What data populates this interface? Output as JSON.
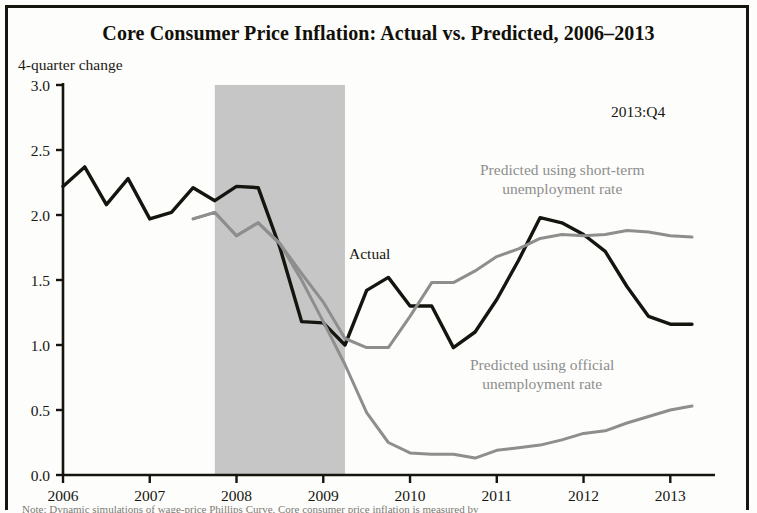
{
  "figure": {
    "title": "Core Consumer Price Inflation: Actual vs. Predicted, 2006–2013",
    "y_axis_caption": "4-quarter change",
    "date_annotation": "2013:Q4",
    "note": "Note: Dynamic simulations of wage-price Phillips Curve. Core consumer price inflation is measured by"
  },
  "labels": {
    "actual": "Actual",
    "predicted_short_line1": "Predicted using short-term",
    "predicted_short_line2": "unemployment rate",
    "predicted_official_line1": "Predicted using official",
    "predicted_official_line2": "unemployment rate"
  },
  "colors": {
    "actual_line": "#15140f",
    "predicted_line": "#8e8e8e",
    "recession_shading": "#c6c6c6",
    "axis": "#15140f",
    "background": "#fdfdfb",
    "frame": "#15140f"
  },
  "chart_data": {
    "type": "line",
    "title": "Core Consumer Price Inflation: Actual vs. Predicted, 2006–2013",
    "xlabel": "",
    "ylabel": "4-quarter change",
    "xlim": [
      2006.0,
      2013.4
    ],
    "ylim": [
      0.0,
      3.0
    ],
    "grid": false,
    "legend_position": "inline-annotations",
    "x_tick_labels": [
      "2006",
      "2007",
      "2008",
      "2009",
      "2010",
      "2011",
      "2012",
      "2013"
    ],
    "x_ticks": [
      2006,
      2007,
      2008,
      2009,
      2010,
      2011,
      2012,
      2013
    ],
    "y_tick_labels": [
      "0.0",
      "0.5",
      "1.0",
      "1.5",
      "2.0",
      "2.5",
      "3.0"
    ],
    "y_ticks": [
      0.0,
      0.5,
      1.0,
      1.5,
      2.0,
      2.5,
      3.0
    ],
    "shaded_regions": [
      {
        "label": "recession",
        "x_start": 2007.75,
        "x_end": 2009.25,
        "color": "#c6c6c6"
      }
    ],
    "annotations": [
      {
        "text": "2013:Q4",
        "x": 2012.9,
        "y": 2.72
      },
      {
        "text": "Actual",
        "x": 2009.75,
        "y": 1.7
      },
      {
        "text": "Predicted using short-term unemployment rate",
        "x": 2011.6,
        "y": 2.35
      },
      {
        "text": "Predicted using official unemployment rate",
        "x": 2011.5,
        "y": 0.86
      }
    ],
    "series": [
      {
        "name": "Actual",
        "color": "#15140f",
        "x": [
          2006.0,
          2006.25,
          2006.5,
          2006.75,
          2007.0,
          2007.25,
          2007.5,
          2007.75,
          2008.0,
          2008.25,
          2008.5,
          2008.75,
          2009.0,
          2009.25,
          2009.5,
          2009.75,
          2010.0,
          2010.25,
          2010.5,
          2010.75,
          2011.0,
          2011.25,
          2011.5,
          2011.75,
          2012.0,
          2012.25,
          2012.5,
          2012.75,
          2013.0,
          2013.25
        ],
        "values": [
          2.22,
          2.37,
          2.08,
          2.28,
          1.97,
          2.02,
          2.21,
          2.11,
          2.22,
          2.21,
          1.75,
          1.18,
          1.17,
          1.0,
          1.42,
          1.52,
          1.3,
          1.3,
          0.98,
          1.1,
          1.35,
          1.65,
          1.98,
          1.94,
          1.85,
          1.72,
          1.45,
          1.22,
          1.16,
          1.16
        ]
      },
      {
        "name": "Predicted using short-term unemployment rate",
        "color": "#8e8e8e",
        "x": [
          2007.5,
          2007.75,
          2008.0,
          2008.25,
          2008.5,
          2008.75,
          2009.0,
          2009.25,
          2009.5,
          2009.75,
          2010.0,
          2010.25,
          2010.5,
          2010.75,
          2011.0,
          2011.25,
          2011.5,
          2011.75,
          2012.0,
          2012.25,
          2012.5,
          2012.75,
          2013.0,
          2013.25
        ],
        "values": [
          1.97,
          2.02,
          1.84,
          1.94,
          1.78,
          1.55,
          1.33,
          1.05,
          0.98,
          0.98,
          1.22,
          1.48,
          1.48,
          1.57,
          1.68,
          1.74,
          1.82,
          1.85,
          1.84,
          1.85,
          1.88,
          1.87,
          1.84,
          1.83
        ]
      },
      {
        "name": "Predicted using official unemployment rate",
        "color": "#8e8e8e",
        "x": [
          2007.5,
          2007.75,
          2008.0,
          2008.25,
          2008.5,
          2008.75,
          2009.0,
          2009.25,
          2009.5,
          2009.75,
          2010.0,
          2010.25,
          2010.5,
          2010.75,
          2011.0,
          2011.25,
          2011.5,
          2011.75,
          2012.0,
          2012.25,
          2012.5,
          2012.75,
          2013.0,
          2013.25
        ],
        "values": [
          1.97,
          2.02,
          1.84,
          1.94,
          1.78,
          1.5,
          1.18,
          0.85,
          0.48,
          0.25,
          0.17,
          0.16,
          0.16,
          0.13,
          0.19,
          0.21,
          0.23,
          0.27,
          0.32,
          0.34,
          0.4,
          0.45,
          0.5,
          0.53
        ]
      }
    ]
  }
}
